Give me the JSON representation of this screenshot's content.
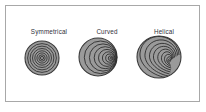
{
  "figure": {
    "background_color": "#ffffff",
    "border_color": "#a8a8a8",
    "width": 206,
    "height": 112
  },
  "style": {
    "shell_fill": "#9a9a9a",
    "shell_fill_dark": "#8b8b8b",
    "shell_outline": "#3a3a3a",
    "ring_line": "#2e2e2e",
    "label_color": "#2f2f3a"
  },
  "panels": [
    {
      "id": "symmetrical",
      "label": "Symmetrical",
      "coiling_type": "planispiral-symmetrical",
      "description": "concentric evenly spaced rings with centered growth axis",
      "ring_count": 7,
      "center_offset_x": 0.0,
      "center_offset_y": 0.0,
      "radius": 16
    },
    {
      "id": "curved",
      "label": "Curved",
      "coiling_type": "eccentric-curved",
      "description": "rings crowded toward a growth center displaced to the right",
      "ring_count": 7,
      "center_offset_x": 0.62,
      "center_offset_y": 0.12,
      "radius": 19
    },
    {
      "id": "helical",
      "label": "Helical",
      "coiling_type": "helical-spiral",
      "description": "logarithmic spiral whorls converging on a low-right apex",
      "ring_count": 9,
      "center_offset_x": 0.48,
      "center_offset_y": 0.42,
      "radius": 22
    }
  ]
}
